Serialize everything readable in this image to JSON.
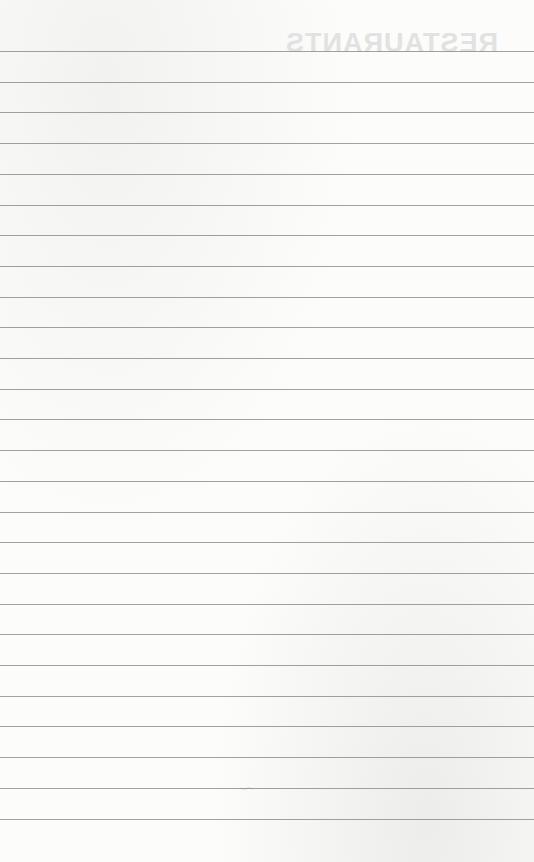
{
  "page": {
    "type": "lined-paper",
    "background_color": "#fbfbfa",
    "rule_color": "#8f8f8f"
  },
  "bleed_through": {
    "title": "RESTAURANTS",
    "signature": "—"
  },
  "rules": {
    "count": 26,
    "first_y": 51,
    "spacing": 30.7
  }
}
